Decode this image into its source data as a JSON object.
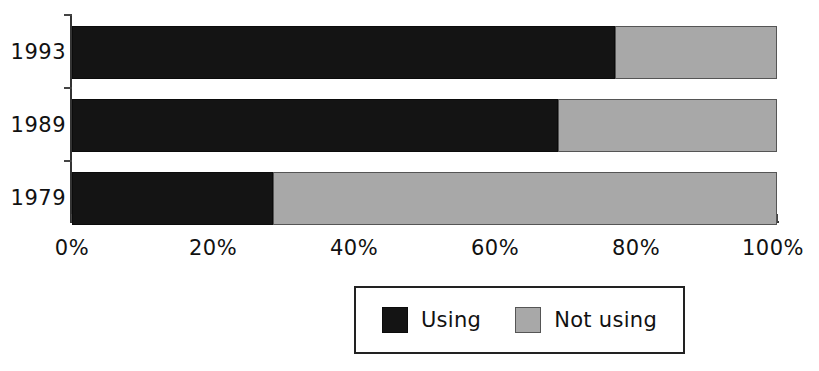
{
  "chart_data": {
    "type": "bar",
    "orientation": "horizontal",
    "stacked": true,
    "normalized": true,
    "title": "",
    "xlabel": "",
    "ylabel": "",
    "categories": [
      "1993",
      "1989",
      "1979"
    ],
    "series": [
      {
        "name": "Using",
        "color": "#141414",
        "values": [
          77,
          69,
          28.5
        ]
      },
      {
        "name": "Not using",
        "color": "#a8a8a8",
        "values": [
          23,
          31,
          71.5
        ]
      }
    ],
    "xlim": [
      0,
      100
    ],
    "xticks": [
      0,
      20,
      40,
      60,
      80,
      100
    ],
    "xtick_labels": [
      "0%",
      "20%",
      "40%",
      "60%",
      "80%",
      "100%"
    ],
    "ytick_labels": [
      "1993",
      "1989",
      "1979"
    ],
    "grid": false,
    "legend": {
      "position": "bottom-center",
      "entries": [
        "Using",
        "Not using"
      ]
    }
  },
  "axis": {
    "x_ticks": [
      {
        "label": "0%",
        "value": 0
      },
      {
        "label": "20%",
        "value": 20
      },
      {
        "label": "40%",
        "value": 40
      },
      {
        "label": "60%",
        "value": 60
      },
      {
        "label": "80%",
        "value": 80
      },
      {
        "label": "100%",
        "value": 100
      }
    ]
  },
  "rows": [
    {
      "year": "1993",
      "using": 77,
      "not_using": 23
    },
    {
      "year": "1989",
      "using": 69,
      "not_using": 31
    },
    {
      "year": "1979",
      "using": 28.5,
      "not_using": 71.5
    }
  ],
  "legend": {
    "using_label": "Using",
    "not_using_label": "Not using"
  },
  "colors": {
    "using": "#141414",
    "not_using": "#a8a8a8",
    "axis": "#333333",
    "text": "#111111",
    "background": "#ffffff"
  }
}
